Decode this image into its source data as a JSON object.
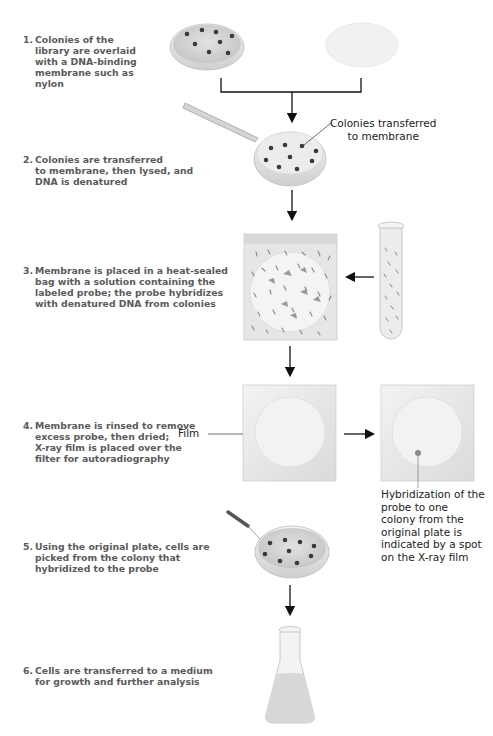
{
  "steps": [
    {
      "number": "1.",
      "text": "Colonies of the\nlibrary are overlaid\nwith a DNA-binding\nmembrane such as\nnylon"
    },
    {
      "number": "2.",
      "text": "Colonies are transferred\nto membrane, then lysed, and\nDNA is denatured"
    },
    {
      "number": "3.",
      "text": "Membrane is placed in a heat-sealed\nbag with a solution containing the\nlabeled probe; the probe hybridizes\nwith denatured DNA from colonies"
    },
    {
      "number": "4.",
      "text": "Membrane is rinsed to remove\nexcess probe, then dried;\nX-ray film is placed over the\nfilter for autoradiography"
    },
    {
      "number": "5.",
      "text": "Using the original plate, cells are\npicked from the colony that\nhybridized to the probe"
    },
    {
      "number": "6.",
      "text": "Cells are transferred to a medium\nfor growth and further analysis"
    }
  ],
  "callouts": {
    "colonies_transferred": "Colonies transferred\nto membrane",
    "film": "Film",
    "hybridization": "Hybridization of the\nprobe to one\ncolony from the\noriginal plate is\nindicated by a spot\non the X-ray film"
  },
  "icons": {
    "petri_dish": "petri-dish-with-colonies",
    "membrane": "nylon-membrane-disc",
    "forceps": "forceps",
    "bag": "heat-sealed-bag",
    "test_tube": "probe-test-tube",
    "film": "x-ray-film",
    "pipette": "pipette",
    "flask": "erlenmeyer-flask"
  },
  "colors": {
    "arrow": "#111111",
    "step_text": "#5a5a5a",
    "colony": "#3a3a3a",
    "film_bg": "#e8e8e8",
    "spot": "#8a8a8a"
  }
}
